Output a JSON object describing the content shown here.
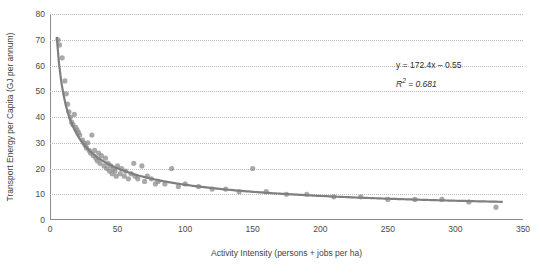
{
  "chart_data": {
    "type": "scatter",
    "title": "",
    "xlabel": "Activity Intensity (persons + jobs per ha)",
    "ylabel": "Transport Energy per Capita (GJ per annum)",
    "xlim": [
      0,
      350
    ],
    "ylim": [
      0,
      80
    ],
    "xticks": [
      0,
      50,
      100,
      150,
      200,
      250,
      300,
      350
    ],
    "yticks": [
      0,
      10,
      20,
      30,
      40,
      50,
      60,
      70,
      80
    ],
    "grid": "horizontal-dotted",
    "legend": "none",
    "annotations": {
      "equation": "y = 172.4x – 0.55",
      "r_squared_label": "R",
      "r_squared_sup": "2",
      "r_squared_value": " = 0.681"
    },
    "series": [
      {
        "name": "Cities",
        "type": "scatter",
        "color": "#8c8c8c",
        "marker": "circle",
        "points": [
          [
            6,
            70
          ],
          [
            7,
            68
          ],
          [
            9,
            63
          ],
          [
            11,
            54
          ],
          [
            12,
            49
          ],
          [
            13,
            45
          ],
          [
            14,
            42
          ],
          [
            15,
            40
          ],
          [
            16,
            38
          ],
          [
            17,
            37
          ],
          [
            18,
            41
          ],
          [
            19,
            36
          ],
          [
            20,
            35
          ],
          [
            21,
            34
          ],
          [
            22,
            33
          ],
          [
            24,
            31
          ],
          [
            25,
            30
          ],
          [
            26,
            29
          ],
          [
            27,
            28
          ],
          [
            28,
            30
          ],
          [
            29,
            27
          ],
          [
            30,
            26
          ],
          [
            31,
            33
          ],
          [
            32,
            25
          ],
          [
            33,
            27
          ],
          [
            34,
            24
          ],
          [
            35,
            23
          ],
          [
            36,
            26
          ],
          [
            37,
            22
          ],
          [
            38,
            25
          ],
          [
            40,
            21
          ],
          [
            41,
            24
          ],
          [
            42,
            20
          ],
          [
            43,
            22
          ],
          [
            44,
            19
          ],
          [
            45,
            21
          ],
          [
            46,
            18
          ],
          [
            47,
            20
          ],
          [
            48,
            19
          ],
          [
            49,
            17
          ],
          [
            50,
            21
          ],
          [
            52,
            18
          ],
          [
            53,
            20
          ],
          [
            55,
            17
          ],
          [
            56,
            19
          ],
          [
            58,
            16
          ],
          [
            60,
            18
          ],
          [
            62,
            22
          ],
          [
            63,
            17
          ],
          [
            65,
            16
          ],
          [
            68,
            21
          ],
          [
            70,
            15
          ],
          [
            72,
            17
          ],
          [
            75,
            16
          ],
          [
            78,
            14
          ],
          [
            80,
            15
          ],
          [
            85,
            14
          ],
          [
            90,
            20
          ],
          [
            95,
            13
          ],
          [
            100,
            14
          ],
          [
            110,
            13
          ],
          [
            120,
            12
          ],
          [
            130,
            12
          ],
          [
            140,
            11
          ],
          [
            150,
            20
          ],
          [
            160,
            11
          ],
          [
            175,
            10
          ],
          [
            190,
            10
          ],
          [
            210,
            9
          ],
          [
            230,
            9
          ],
          [
            250,
            8
          ],
          [
            270,
            8
          ],
          [
            290,
            8
          ],
          [
            310,
            7
          ],
          [
            330,
            5
          ]
        ]
      },
      {
        "name": "Power trendline",
        "type": "line",
        "color": "#7f7f7f",
        "formula": "y = 172.4 * x^(-0.55)",
        "points": [
          [
            6,
            62.8
          ],
          [
            8,
            53.5
          ],
          [
            10,
            47.3
          ],
          [
            12,
            42.8
          ],
          [
            15,
            37.8
          ],
          [
            18,
            34.1
          ],
          [
            21,
            31.3
          ],
          [
            25,
            28.4
          ],
          [
            30,
            25.6
          ],
          [
            35,
            23.4
          ],
          [
            40,
            21.7
          ],
          [
            45,
            20.3
          ],
          [
            50,
            19.1
          ],
          [
            60,
            17.2
          ],
          [
            70,
            15.8
          ],
          [
            80,
            14.7
          ],
          [
            90,
            13.8
          ],
          [
            100,
            13.0
          ],
          [
            120,
            11.7
          ],
          [
            140,
            10.8
          ],
          [
            160,
            10.0
          ],
          [
            180,
            9.4
          ],
          [
            200,
            8.8
          ],
          [
            225,
            8.3
          ],
          [
            250,
            7.8
          ],
          [
            275,
            7.4
          ],
          [
            300,
            7.1
          ],
          [
            330,
            6.7
          ]
        ]
      }
    ]
  }
}
